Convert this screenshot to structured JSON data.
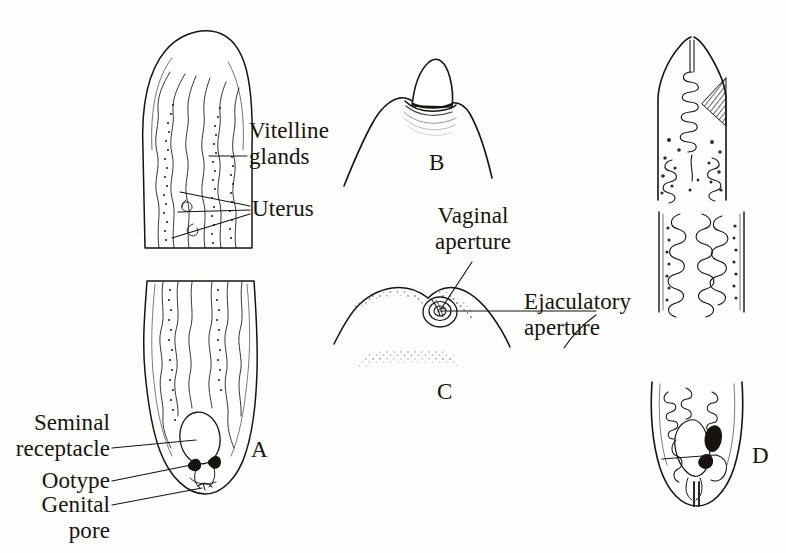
{
  "figure": {
    "kind": "scientific-illustration",
    "style": "pen-and-ink line drawing",
    "background_color": "#fdfdfc",
    "ink_color": "#17140f"
  },
  "panels": [
    {
      "letter": "A",
      "caption": "A",
      "description": "whole-body ventral view, anterior fragment above and posterior fragment below"
    },
    {
      "letter": "B",
      "caption": "B",
      "description": "anterior tip with protruding conical papilla"
    },
    {
      "letter": "C",
      "caption": "C",
      "description": "lateral view of genital region showing paired apertures"
    },
    {
      "letter": "D",
      "caption": "D",
      "description": "posterior end with darkly stained organs"
    }
  ],
  "labels": [
    {
      "id": "vitelline-glands",
      "text": "Vitelline\nglands",
      "align": "left"
    },
    {
      "id": "uterus",
      "text": "Uterus",
      "align": "left"
    },
    {
      "id": "seminal-receptacle",
      "text": "Seminal\nreceptacle",
      "align": "right"
    },
    {
      "id": "ootype",
      "text": "Ootype",
      "align": "right"
    },
    {
      "id": "genital-pore",
      "text": "Genital\npore",
      "align": "right"
    },
    {
      "id": "vaginal-aperture",
      "text": "Vaginal\naperture",
      "align": "center"
    },
    {
      "id": "ejaculatory-aperture",
      "text": "Ejaculatory\naperture",
      "align": "left"
    }
  ],
  "label_text": {
    "vitelline_glands": "Vitelline\nglands",
    "uterus": "Uterus",
    "seminal_receptacle": "Seminal\nreceptacle",
    "ootype": "Ootype",
    "genital_pore": "Genital\npore",
    "vaginal_aperture": "Vaginal\naperture",
    "ejaculatory_aperture": "Ejaculatory\naperture"
  },
  "panel_letters": {
    "a": "A",
    "b": "B",
    "c": "C",
    "d": "D"
  }
}
